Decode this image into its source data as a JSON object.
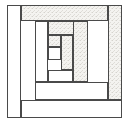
{
  "figure": {
    "name": "log-cabin-quilt-block",
    "canvas": {
      "width": 130,
      "height": 123,
      "background": "#ffffff"
    },
    "frame": {
      "x": 7,
      "y": 5,
      "width": 115,
      "height": 113
    }
  },
  "style": {
    "light_fill": "#ffffff",
    "dark_fill": "#f2f1ee",
    "stroke_color": "#4a4a4a",
    "stroke_width": 1,
    "texture_color": "#d8d6d1"
  },
  "chart_data": {
    "type": "diagram",
    "xlabel": "",
    "ylabel": "",
    "xlim": [
      0,
      130
    ],
    "ylim": [
      0,
      123
    ],
    "grid": false,
    "legend": "none",
    "gridlines": {
      "vertical_x": [
        7,
        21,
        35,
        48,
        61,
        73,
        88,
        108,
        122
      ],
      "horizontal_y": [
        5,
        21,
        35,
        47,
        60,
        70,
        82,
        100,
        118
      ]
    },
    "rings": [
      {
        "ring": 1,
        "label": "outer ring"
      },
      {
        "ring": 2,
        "label": "second ring"
      },
      {
        "ring": 3,
        "label": "third ring"
      },
      {
        "ring": 4,
        "label": "inner ring"
      },
      {
        "ring": 5,
        "label": "center"
      }
    ],
    "pieces": [
      {
        "id": "log-outer-top",
        "ring": 1,
        "shade": "dark",
        "x": 21,
        "y": 5,
        "w": 87,
        "h": 16
      },
      {
        "id": "log-outer-right",
        "ring": 1,
        "shade": "dark",
        "x": 108,
        "y": 5,
        "w": 14,
        "h": 95
      },
      {
        "id": "log-outer-bottom",
        "ring": 1,
        "shade": "light",
        "x": 21,
        "y": 100,
        "w": 101,
        "h": 18
      },
      {
        "id": "log-outer-left",
        "ring": 1,
        "shade": "light",
        "x": 7,
        "y": 5,
        "w": 14,
        "h": 113
      },
      {
        "id": "log-second-top",
        "ring": 2,
        "shade": "dark",
        "x": 48,
        "y": 21,
        "w": 40,
        "h": 14
      },
      {
        "id": "log-second-right",
        "ring": 2,
        "shade": "dark",
        "x": 73,
        "y": 21,
        "w": 15,
        "h": 61
      },
      {
        "id": "log-second-bottom",
        "ring": 2,
        "shade": "light",
        "x": 35,
        "y": 82,
        "w": 73,
        "h": 18
      },
      {
        "id": "log-second-left",
        "ring": 2,
        "shade": "light",
        "x": 35,
        "y": 21,
        "w": 13,
        "h": 61
      },
      {
        "id": "log-third-top",
        "ring": 3,
        "shade": "dark",
        "x": 48,
        "y": 35,
        "w": 25,
        "h": 12
      },
      {
        "id": "log-third-right",
        "ring": 3,
        "shade": "dark",
        "x": 61,
        "y": 35,
        "w": 12,
        "h": 35
      },
      {
        "id": "log-third-bottom",
        "ring": 3,
        "shade": "light",
        "x": 48,
        "y": 70,
        "w": 25,
        "h": 12
      },
      {
        "id": "log-third-left",
        "ring": 3,
        "shade": "light",
        "x": 48,
        "y": 35,
        "w": 0,
        "h": 35
      },
      {
        "id": "center-square",
        "ring": 5,
        "shade": "light",
        "x": 48,
        "y": 47,
        "w": 13,
        "h": 13
      },
      {
        "id": "center-top-block",
        "ring": 4,
        "shade": "dark",
        "x": 48,
        "y": 35,
        "w": 13,
        "h": 12
      }
    ],
    "counts": {
      "total_pieces": 14,
      "light_pieces": 6,
      "dark_pieces": 8
    }
  }
}
